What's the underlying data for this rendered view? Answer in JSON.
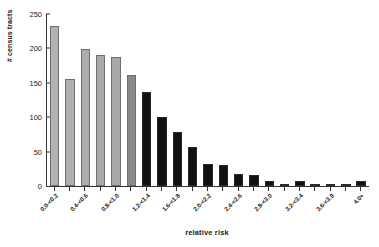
{
  "chart_data": {
    "type": "bar",
    "title": "",
    "xlabel": "relative risk",
    "ylabel": "# census tracts",
    "ylim": [
      0,
      250
    ],
    "yticks": [
      0,
      50,
      100,
      150,
      200,
      250
    ],
    "grid": false,
    "legend": null,
    "categories": [
      "0.0-<0.2",
      "0.2-<0.4",
      "0.4-<0.6",
      "0.6-<0.8",
      "0.8-<1.0",
      "1.0-<1.2",
      "1.2-<1.4",
      "1.4-<1.6",
      "1.6-<1.8",
      "1.8-<2.0",
      "2.0-<2.2",
      "2.2-<2.4",
      "2.4-<2.6",
      "2.6-<2.8",
      "2.8-<3.0",
      "3.0-<3.2",
      "3.2-<3.4",
      "3.4-<3.6",
      "3.6-<3.9",
      "3.9-<4.0",
      "4.0+"
    ],
    "visible_tick_labels": [
      "0.0-<0.2",
      "",
      "0.4-<0.6",
      "",
      "0.8-<1.0",
      "",
      "1.2-<1.4",
      "",
      "1.6-<1.8",
      "",
      "2.0-<2.2",
      "",
      "2.4-<2.6",
      "",
      "2.8-<3.0",
      "",
      "3.2-<3.4",
      "",
      "3.6-<3.9",
      "",
      "4.0+"
    ],
    "values": [
      232,
      155,
      199,
      190,
      188,
      162,
      136,
      101,
      79,
      57,
      32,
      31,
      17,
      16,
      8,
      3,
      7,
      3,
      1,
      0,
      7
    ],
    "bar_colors": [
      "#b3b3b3",
      "#b0b0b0",
      "#adadad",
      "#aaaaaa",
      "#a8a8a8",
      "#8a8a8a",
      "#111111",
      "#111111",
      "#111111",
      "#111111",
      "#111111",
      "#111111",
      "#111111",
      "#111111",
      "#111111",
      "#111111",
      "#111111",
      "#111111",
      "#111111",
      "#111111",
      "#111111"
    ]
  },
  "axis": {
    "color": "#333333"
  }
}
